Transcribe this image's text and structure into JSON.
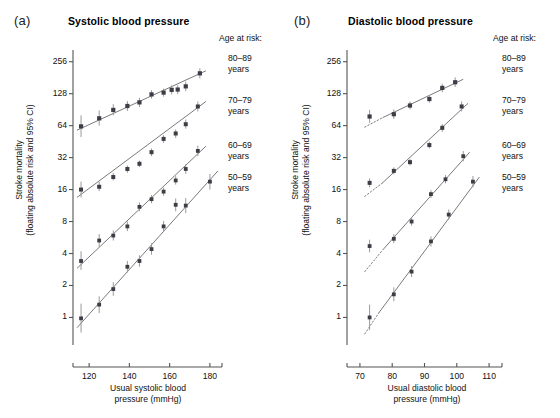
{
  "figure": {
    "panels": [
      {
        "letter": "(a)",
        "title": "Systolic blood pressure",
        "y_axis_label_line1": "Stroke mortality",
        "y_axis_label_line2": "(floating absolute risk and 95% CI)",
        "x_axis_label_line1": "Usual systolic blood",
        "x_axis_label_line2": "pressure (mmHg)",
        "y_ticks": [
          1,
          2,
          4,
          8,
          16,
          32,
          64,
          128,
          256
        ],
        "x_ticks": [
          120,
          140,
          160,
          180
        ],
        "legend_title": "Age at risk:",
        "legend_items": [
          {
            "range": "80–89",
            "unit": "years"
          },
          {
            "range": "70–79",
            "unit": "years"
          },
          {
            "range": "60–69",
            "unit": "years"
          },
          {
            "range": "50–59",
            "unit": "years"
          }
        ]
      },
      {
        "letter": "(b)",
        "title": "Diastolic blood pressure",
        "y_axis_label_line1": "Stroke mortality",
        "y_axis_label_line2": "(floating absolute risk and 95% CI)",
        "x_axis_label_line1": "Usual diastolic blood",
        "x_axis_label_line2": "pressure (mmHg)",
        "y_ticks": [
          1,
          2,
          4,
          8,
          16,
          32,
          64,
          128,
          256
        ],
        "x_ticks": [
          70,
          80,
          90,
          100,
          110
        ],
        "legend_title": "Age at risk:",
        "legend_items": [
          {
            "range": "80–89",
            "unit": "years"
          },
          {
            "range": "70–79",
            "unit": "years"
          },
          {
            "range": "60–69",
            "unit": "years"
          },
          {
            "range": "50–59",
            "unit": "years"
          }
        ]
      }
    ]
  },
  "colors": {
    "point": "#3d3d46",
    "errorbar": "#9a9a9a",
    "fitline": "#6b6b6b",
    "axis": "#555555",
    "text": "#111111",
    "background": "#ffffff"
  },
  "chart_data": [
    {
      "type": "scatter",
      "panel": "(a)",
      "title": "Systolic blood pressure",
      "xlabel": "Usual systolic blood pressure (mmHg)",
      "ylabel": "Stroke mortality (floating absolute risk and 95% CI)",
      "yscale": "log2",
      "ylim": [
        0.55,
        330
      ],
      "xlim": [
        112,
        186
      ],
      "yticks": [
        1,
        2,
        4,
        8,
        16,
        32,
        64,
        128,
        256
      ],
      "xticks": [
        120,
        140,
        160,
        180
      ],
      "grid": false,
      "legend_position": "right",
      "legend_title": "Age at risk:",
      "series": [
        {
          "name": "80–89 years",
          "points": [
            {
              "x": 116,
              "y": 63,
              "lo": 50,
              "hi": 80
            },
            {
              "x": 125,
              "y": 75,
              "lo": 64,
              "hi": 89
            },
            {
              "x": 132,
              "y": 90,
              "lo": 80,
              "hi": 102
            },
            {
              "x": 139,
              "y": 98,
              "lo": 88,
              "hi": 109
            },
            {
              "x": 145,
              "y": 106,
              "lo": 96,
              "hi": 117
            },
            {
              "x": 151,
              "y": 126,
              "lo": 115,
              "hi": 138
            },
            {
              "x": 157,
              "y": 131,
              "lo": 120,
              "hi": 143
            },
            {
              "x": 161,
              "y": 139,
              "lo": 126,
              "hi": 153
            },
            {
              "x": 164,
              "y": 140,
              "lo": 127,
              "hi": 154
            },
            {
              "x": 168,
              "y": 150,
              "lo": 135,
              "hi": 166
            },
            {
              "x": 175,
              "y": 199,
              "lo": 178,
              "hi": 222
            }
          ],
          "fit": {
            "x0": 114,
            "y0": 58,
            "x1": 178,
            "y1": 210
          }
        },
        {
          "name": "70–79 years",
          "points": [
            {
              "x": 116,
              "y": 16,
              "lo": 13.5,
              "hi": 19
            },
            {
              "x": 125,
              "y": 17,
              "lo": 15.5,
              "hi": 19
            },
            {
              "x": 132,
              "y": 21,
              "lo": 19.5,
              "hi": 23
            },
            {
              "x": 139,
              "y": 25,
              "lo": 23,
              "hi": 27
            },
            {
              "x": 145,
              "y": 28,
              "lo": 26,
              "hi": 30
            },
            {
              "x": 151,
              "y": 36,
              "lo": 33,
              "hi": 39
            },
            {
              "x": 157,
              "y": 48,
              "lo": 44,
              "hi": 52
            },
            {
              "x": 163,
              "y": 54,
              "lo": 49,
              "hi": 59
            },
            {
              "x": 168,
              "y": 66,
              "lo": 60,
              "hi": 73
            },
            {
              "x": 174,
              "y": 97,
              "lo": 87,
              "hi": 108
            }
          ],
          "fit": {
            "x0": 114,
            "y0": 13.5,
            "x1": 178,
            "y1": 108
          }
        },
        {
          "name": "60–69 years",
          "points": [
            {
              "x": 116,
              "y": 3.4,
              "lo": 2.8,
              "hi": 4.2
            },
            {
              "x": 125,
              "y": 5.3,
              "lo": 4.6,
              "hi": 6.1
            },
            {
              "x": 132,
              "y": 5.9,
              "lo": 5.3,
              "hi": 6.6
            },
            {
              "x": 139,
              "y": 7.2,
              "lo": 6.5,
              "hi": 8.0
            },
            {
              "x": 145,
              "y": 11.0,
              "lo": 10.0,
              "hi": 12.1
            },
            {
              "x": 151,
              "y": 13.0,
              "lo": 11.9,
              "hi": 14.2
            },
            {
              "x": 157,
              "y": 15.3,
              "lo": 14.0,
              "hi": 16.7
            },
            {
              "x": 163,
              "y": 19.5,
              "lo": 17.8,
              "hi": 21.4
            },
            {
              "x": 168,
              "y": 25.0,
              "lo": 22.5,
              "hi": 27.8
            },
            {
              "x": 174,
              "y": 37.0,
              "lo": 33.0,
              "hi": 41.5
            }
          ],
          "fit": {
            "x0": 114,
            "y0": 2.9,
            "x1": 178,
            "y1": 41
          }
        },
        {
          "name": "50–59 years",
          "points": [
            {
              "x": 116,
              "y": 0.98,
              "lo": 0.72,
              "hi": 1.35
            },
            {
              "x": 125,
              "y": 1.32,
              "lo": 1.1,
              "hi": 1.58
            },
            {
              "x": 132,
              "y": 1.85,
              "lo": 1.6,
              "hi": 2.15
            },
            {
              "x": 139,
              "y": 3.0,
              "lo": 2.65,
              "hi": 3.4
            },
            {
              "x": 145,
              "y": 3.4,
              "lo": 3.0,
              "hi": 3.85
            },
            {
              "x": 151,
              "y": 4.4,
              "lo": 3.9,
              "hi": 5.0
            },
            {
              "x": 157,
              "y": 7.2,
              "lo": 6.4,
              "hi": 8.1
            },
            {
              "x": 163,
              "y": 11.5,
              "lo": 10.0,
              "hi": 13.2
            },
            {
              "x": 168,
              "y": 11.3,
              "lo": 9.6,
              "hi": 13.3
            },
            {
              "x": 180,
              "y": 19.0,
              "lo": 16.0,
              "hi": 22.5
            }
          ],
          "fit": {
            "x0": 114,
            "y0": 0.8,
            "x1": 184,
            "y1": 24
          }
        }
      ]
    },
    {
      "type": "scatter",
      "panel": "(b)",
      "title": "Diastolic blood pressure",
      "xlabel": "Usual diastolic blood pressure (mmHg)",
      "ylabel": "Stroke mortality (floating absolute risk and 95% CI)",
      "yscale": "log2",
      "ylim": [
        0.55,
        330
      ],
      "xlim": [
        66,
        114
      ],
      "yticks": [
        1,
        2,
        4,
        8,
        16,
        32,
        64,
        128,
        256
      ],
      "xticks": [
        70,
        80,
        90,
        100,
        110
      ],
      "grid": false,
      "legend_position": "right",
      "legend_title": "Age at risk:",
      "series": [
        {
          "name": "80–89 years",
          "points": [
            {
              "x": 73.0,
              "y": 78,
              "lo": 68,
              "hi": 90
            },
            {
              "x": 80.5,
              "y": 82,
              "lo": 74,
              "hi": 91
            },
            {
              "x": 85.5,
              "y": 99,
              "lo": 91,
              "hi": 108
            },
            {
              "x": 91.5,
              "y": 114,
              "lo": 105,
              "hi": 124
            },
            {
              "x": 95.5,
              "y": 145,
              "lo": 132,
              "hi": 159
            },
            {
              "x": 99.5,
              "y": 164,
              "lo": 148,
              "hi": 182
            }
          ],
          "fit": {
            "x0": 77,
            "y0": 76,
            "x1": 102,
            "y1": 175
          },
          "fit_dashed": {
            "x0": 71.5,
            "y0": 62,
            "x1": 77,
            "y1": 76
          }
        },
        {
          "name": "70–79 years",
          "points": [
            {
              "x": 73.0,
              "y": 18.5,
              "lo": 16.8,
              "hi": 20.4
            },
            {
              "x": 80.5,
              "y": 24,
              "lo": 22.3,
              "hi": 25.9
            },
            {
              "x": 85.5,
              "y": 29,
              "lo": 27.0,
              "hi": 31.2
            },
            {
              "x": 91.5,
              "y": 42,
              "lo": 39.0,
              "hi": 45.2
            },
            {
              "x": 95.5,
              "y": 61,
              "lo": 56.0,
              "hi": 66.4
            },
            {
              "x": 101.5,
              "y": 97,
              "lo": 87.0,
              "hi": 108.0
            }
          ],
          "fit": {
            "x0": 77,
            "y0": 18.5,
            "x1": 103.5,
            "y1": 104
          },
          "fit_dashed": {
            "x0": 71.5,
            "y0": 13.8,
            "x1": 77,
            "y1": 18.5
          }
        },
        {
          "name": "60–69 years",
          "points": [
            {
              "x": 73.0,
              "y": 4.7,
              "lo": 4.1,
              "hi": 5.4
            },
            {
              "x": 80.5,
              "y": 5.5,
              "lo": 5.0,
              "hi": 6.1
            },
            {
              "x": 86.0,
              "y": 8.0,
              "lo": 7.3,
              "hi": 8.8
            },
            {
              "x": 92.0,
              "y": 14.5,
              "lo": 13.3,
              "hi": 15.8
            },
            {
              "x": 96.5,
              "y": 20.0,
              "lo": 18.3,
              "hi": 21.9
            },
            {
              "x": 102.0,
              "y": 33.0,
              "lo": 29.5,
              "hi": 36.9
            }
          ],
          "fit": {
            "x0": 77,
            "y0": 4.3,
            "x1": 104,
            "y1": 36
          },
          "fit_dashed": {
            "x0": 71.5,
            "y0": 2.7,
            "x1": 77,
            "y1": 4.3
          }
        },
        {
          "name": "50–59 years",
          "points": [
            {
              "x": 73.0,
              "y": 1.0,
              "lo": 0.76,
              "hi": 1.32
            },
            {
              "x": 80.5,
              "y": 1.65,
              "lo": 1.42,
              "hi": 1.92
            },
            {
              "x": 86.0,
              "y": 2.7,
              "lo": 2.4,
              "hi": 3.05
            },
            {
              "x": 92.0,
              "y": 5.2,
              "lo": 4.65,
              "hi": 5.8
            },
            {
              "x": 97.5,
              "y": 9.3,
              "lo": 8.3,
              "hi": 10.4
            },
            {
              "x": 105.0,
              "y": 19.0,
              "lo": 16.8,
              "hi": 21.5
            }
          ],
          "fit": {
            "x0": 76,
            "y0": 1.12,
            "x1": 107,
            "y1": 21
          },
          "fit_dashed": {
            "x0": 71.5,
            "y0": 0.7,
            "x1": 76,
            "y1": 1.12
          }
        }
      ]
    }
  ]
}
